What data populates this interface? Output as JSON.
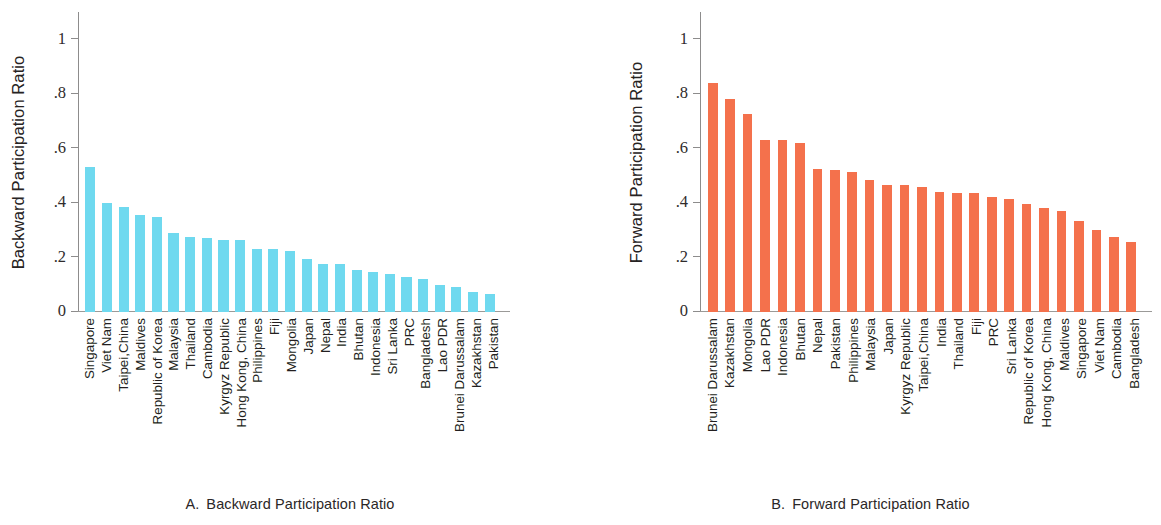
{
  "figure": {
    "panels": [
      {
        "key": "A",
        "caption_label": "A.",
        "caption_text": "Backward Participation Ratio",
        "y_title": "Backward Participation Ratio",
        "color": "#6fd9ef",
        "y_ticks": [
          "0",
          ".2",
          ".4",
          ".6",
          ".8",
          "1"
        ]
      },
      {
        "key": "B",
        "caption_label": "B.",
        "caption_text": "Forward Participation Ratio",
        "y_title": "Forward Participation Ratio",
        "color": "#f4714c",
        "y_ticks": [
          "0",
          ".2",
          ".4",
          ".6",
          ".8",
          "1"
        ]
      }
    ]
  },
  "chart_data": [
    {
      "type": "bar",
      "panel": "A",
      "title": "A.  Backward Participation Ratio",
      "xlabel": "",
      "ylabel": "Backward Participation Ratio",
      "ylim": [
        0,
        1.1
      ],
      "yticks": [
        0,
        0.2,
        0.4,
        0.6,
        0.8,
        1
      ],
      "ytick_labels": [
        "0",
        ".2",
        ".4",
        ".6",
        ".8",
        "1"
      ],
      "grid": false,
      "legend": "none",
      "bar_color": "#6fd9ef",
      "categories": [
        "Singapore",
        "Viet Nam",
        "Taipei,China",
        "Maldives",
        "Republic of Korea",
        "Malaysia",
        "Thailand",
        "Cambodia",
        "Kyrgyz Republic",
        "Hong Kong, China",
        "Philippines",
        "Fiji",
        "Mongolia",
        "Japan",
        "Nepal",
        "India",
        "Bhutan",
        "Indonesia",
        "Sri Lanka",
        "PRC",
        "Bangladesh",
        "Lao PDR",
        "Brunei Darussalam",
        "Kazakhstan",
        "Pakistan"
      ],
      "values": [
        0.53,
        0.4,
        0.385,
        0.355,
        0.35,
        0.29,
        0.275,
        0.27,
        0.265,
        0.265,
        0.23,
        0.23,
        0.225,
        0.195,
        0.175,
        0.175,
        0.155,
        0.147,
        0.14,
        0.13,
        0.12,
        0.1,
        0.09,
        0.075,
        0.065
      ]
    },
    {
      "type": "bar",
      "panel": "B",
      "title": "B.  Forward Participation Ratio",
      "xlabel": "",
      "ylabel": "Forward Participation Ratio",
      "ylim": [
        0,
        1.1
      ],
      "yticks": [
        0,
        0.2,
        0.4,
        0.6,
        0.8,
        1
      ],
      "ytick_labels": [
        "0",
        ".2",
        ".4",
        ".6",
        ".8",
        "1"
      ],
      "grid": false,
      "legend": "none",
      "bar_color": "#f4714c",
      "categories": [
        "Brunei Darussalam",
        "Kazakhstan",
        "Mongolia",
        "Lao PDR",
        "Indonesia",
        "Bhutan",
        "Nepal",
        "Pakistan",
        "Philippines",
        "Malaysia",
        "Japan",
        "Kyrgyz Republic",
        "Taipei,China",
        "India",
        "Thailand",
        "Fiji",
        "PRC",
        "Sri Lanka",
        "Republic of Korea",
        "Hong Kong, China",
        "Maldives",
        "Singapore",
        "Viet Nam",
        "Cambodia",
        "Bangladesh"
      ],
      "values": [
        0.84,
        0.78,
        0.725,
        0.63,
        0.63,
        0.62,
        0.525,
        0.52,
        0.515,
        0.485,
        0.465,
        0.465,
        0.46,
        0.44,
        0.435,
        0.435,
        0.42,
        0.415,
        0.395,
        0.38,
        0.37,
        0.335,
        0.3,
        0.275,
        0.255
      ]
    }
  ]
}
